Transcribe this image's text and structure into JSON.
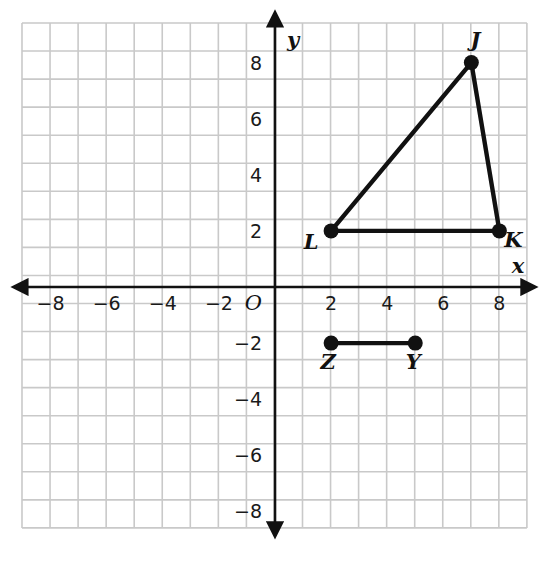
{
  "chart_data": {
    "type": "scatter",
    "title": "",
    "xlabel": "x",
    "ylabel": "y",
    "origin_label": "O",
    "grid": true,
    "xlim": [
      -9,
      9
    ],
    "ylim": [
      -9,
      9
    ],
    "x_ticks": [
      -8,
      -6,
      -4,
      -2,
      2,
      4,
      6,
      8
    ],
    "y_ticks": [
      8,
      6,
      4,
      2,
      -2,
      -4,
      -6,
      -8
    ],
    "x_tick_labels": [
      "−8",
      "−6",
      "−4",
      "−2",
      "2",
      "4",
      "6",
      "8"
    ],
    "y_tick_labels": [
      "8",
      "6",
      "4",
      "2",
      "−2",
      "−4",
      "−6",
      "−8"
    ],
    "grid_step": 1,
    "series": [
      {
        "name": "triangle-JKL",
        "kind": "closed-polygon",
        "points": [
          {
            "label": "J",
            "x": 7,
            "y": 8,
            "label_dx": 4,
            "label_dy": -16
          },
          {
            "label": "K",
            "x": 8,
            "y": 2,
            "label_dx": 14,
            "label_dy": 16
          },
          {
            "label": "L",
            "x": 2,
            "y": 2,
            "label_dx": -20,
            "label_dy": 18
          }
        ]
      },
      {
        "name": "segment-ZY",
        "kind": "open-segment",
        "points": [
          {
            "label": "Z",
            "x": 2,
            "y": -2,
            "label_dx": -3,
            "label_dy": 26
          },
          {
            "label": "Y",
            "x": 5,
            "y": -2,
            "label_dx": -2,
            "label_dy": 26
          }
        ]
      }
    ],
    "colors": {
      "grid": "#c9c9c9",
      "axis": "#111111",
      "stroke": "#111111",
      "point_fill": "#111111",
      "background": "#ffffff"
    },
    "geometry": {
      "grid_left": 22,
      "grid_top": 23,
      "cell": 28.05,
      "cells_x": 18,
      "cells_y": 18,
      "origin_x": 275,
      "origin_y": 287
    }
  },
  "figure": {
    "alt": "Coordinate grid showing triangle J K L and segment Z Y"
  }
}
